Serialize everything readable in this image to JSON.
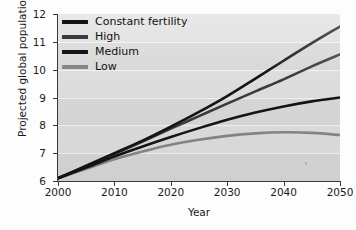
{
  "chart_data": {
    "type": "line",
    "title": "",
    "xlabel": "Year",
    "ylabel": "Projected global population (billions)",
    "xlim": [
      2000,
      2050
    ],
    "ylim": [
      6,
      12
    ],
    "xticks": [
      "2000",
      "2010",
      "2020",
      "2030",
      "2040",
      "2050"
    ],
    "yticks": [
      "6",
      "7",
      "8",
      "9",
      "10",
      "11",
      "12"
    ],
    "grid": "horizontal",
    "legend_position": "top-left",
    "x": [
      2000,
      2005,
      2010,
      2015,
      2020,
      2025,
      2030,
      2035,
      2040,
      2045,
      2050
    ],
    "series": [
      {
        "name": "Constant fertility",
        "color": "#141414",
        "values": [
          6.1,
          6.55,
          7.0,
          7.45,
          7.95,
          8.48,
          9.05,
          9.68,
          10.32,
          10.95,
          11.55
        ]
      },
      {
        "name": "High",
        "color": "#3b3b3b",
        "values": [
          6.1,
          6.53,
          6.97,
          7.42,
          7.88,
          8.33,
          8.78,
          9.22,
          9.65,
          10.12,
          10.55
        ]
      },
      {
        "name": "Medium",
        "color": "#141414",
        "values": [
          6.1,
          6.48,
          6.88,
          7.24,
          7.58,
          7.9,
          8.2,
          8.46,
          8.68,
          8.86,
          9.0
        ]
      },
      {
        "name": "Low",
        "color": "#868686",
        "values": [
          6.1,
          6.44,
          6.78,
          7.06,
          7.3,
          7.48,
          7.62,
          7.71,
          7.75,
          7.73,
          7.65
        ]
      }
    ]
  },
  "axes": {
    "ylabel": "Projected global population (billions)",
    "xlabel": "Year",
    "yticks": [
      "12",
      "11",
      "10",
      "9",
      "8",
      "7",
      "6"
    ],
    "xticks": [
      "2000",
      "2010",
      "2020",
      "2030",
      "2040",
      "2050"
    ]
  },
  "legend": {
    "items": [
      {
        "label": "Constant fertility",
        "color": "#141414"
      },
      {
        "label": "High",
        "color": "#3b3b3b"
      },
      {
        "label": "Medium",
        "color": "#141414"
      },
      {
        "label": "Low",
        "color": "#868686"
      }
    ]
  }
}
